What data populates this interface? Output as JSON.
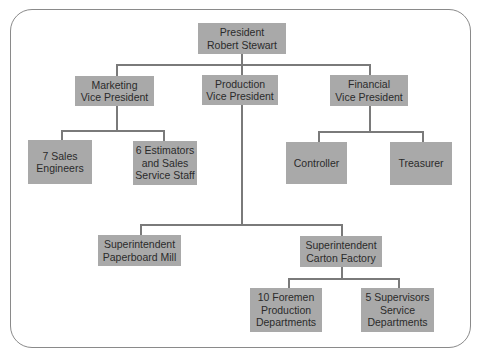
{
  "chart": {
    "nodes": {
      "president": "President\nRobert Stewart",
      "marketing_vp": "Marketing\nVice President",
      "production_vp": "Production\nVice President",
      "financial_vp": "Financial\nVice President",
      "sales_engineers": "7 Sales\nEngineers",
      "estimators": "6 Estimators\nand Sales\nService Staff",
      "controller": "Controller",
      "treasurer": "Treasurer",
      "supt_paperboard": "Superintendent\nPaperboard Mill",
      "supt_carton": "Superintendent\nCarton Factory",
      "foremen": "10 Foremen\nProduction\nDepartments",
      "supervisors": "5 Supervisors\nService\nDepartments"
    },
    "edges": [
      [
        "president",
        "marketing_vp"
      ],
      [
        "president",
        "production_vp"
      ],
      [
        "president",
        "financial_vp"
      ],
      [
        "marketing_vp",
        "sales_engineers"
      ],
      [
        "marketing_vp",
        "estimators"
      ],
      [
        "financial_vp",
        "controller"
      ],
      [
        "financial_vp",
        "treasurer"
      ],
      [
        "production_vp",
        "supt_paperboard"
      ],
      [
        "production_vp",
        "supt_carton"
      ],
      [
        "supt_carton",
        "foremen"
      ],
      [
        "supt_carton",
        "supervisors"
      ]
    ],
    "colors": {
      "box": "#a9a9a9",
      "line": "#7a7a7a",
      "text": "#2b2b2b",
      "frame": "#8a8a8a"
    }
  }
}
